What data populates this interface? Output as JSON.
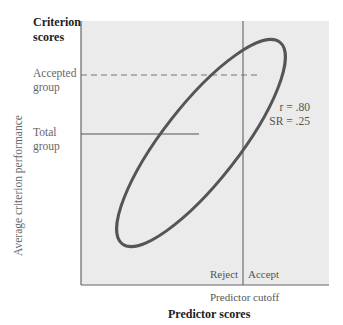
{
  "diagram": {
    "y_axis": {
      "header": [
        "Criterion",
        "scores"
      ],
      "title": "Average criterion performance",
      "levels": [
        {
          "label": [
            "Accepted",
            "group"
          ],
          "style": "dashed"
        },
        {
          "label": [
            "Total",
            "group"
          ],
          "style": "solid"
        }
      ]
    },
    "x_axis": {
      "title": "Predictor scores",
      "cutoff_label": "Predictor cutoff",
      "regions": {
        "left": "Reject",
        "right": "Accept"
      }
    },
    "stats": {
      "r": "r = .80",
      "sr": "SR = .25"
    },
    "colors": {
      "plot_bg": "#ebebeb",
      "axis": "#555555",
      "ellipse": "#555555"
    }
  }
}
